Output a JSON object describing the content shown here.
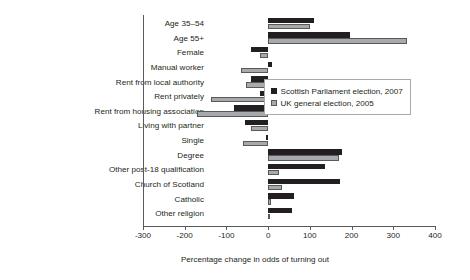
{
  "chart_data": {
    "type": "bar",
    "orientation": "horizontal",
    "title": "",
    "xlabel": "Percentage change in odds of turning out",
    "ylabel": "",
    "xlim": [
      -300,
      400
    ],
    "xticks": [
      -300,
      -200,
      -100,
      0,
      100,
      200,
      300,
      400
    ],
    "xtick_labels": [
      "-300",
      "-200",
      "-100",
      "0",
      "100",
      "200",
      "300",
      "400"
    ],
    "grid": false,
    "legend_position": "center-right",
    "categories": [
      "Age 35–54",
      "Age 55+",
      "Female",
      "Manual worker",
      "Rent from local authority",
      "Rent privately",
      "Rent from housing association",
      "Living with partner",
      "Single",
      "Degree",
      "Other post-18 qualification",
      "Church of Scotland",
      "Catholic",
      "Other religion"
    ],
    "series": [
      {
        "name": "Scottish Parliament election, 2007",
        "color": "#231f20",
        "values": [
          111,
          196,
          -40,
          10,
          -40,
          -20,
          -81,
          -56,
          -4,
          178,
          137,
          172,
          61,
          57
        ]
      },
      {
        "name": "UK general election, 2005",
        "color": "#a7a9ac",
        "values": [
          101,
          333,
          -20,
          -66,
          -54,
          -137,
          -170,
          -40,
          -61,
          170,
          26,
          34,
          6,
          2
        ]
      }
    ]
  },
  "legend": {
    "entries": [
      "Scottish Parliament election, 2007",
      "UK general election, 2005"
    ]
  }
}
